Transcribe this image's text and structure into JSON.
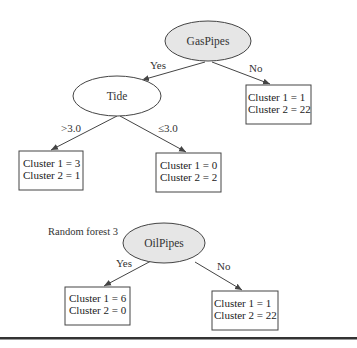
{
  "tree1": {
    "root": {
      "label": "GasPipes"
    },
    "edges": {
      "root_yes": "Yes",
      "root_no": "No",
      "tide_gt": ">3.0",
      "tide_le": "≤3.0"
    },
    "tide": {
      "label": "Tide"
    },
    "leaf_no": {
      "line1": "Cluster 1 = 1",
      "line2": "Cluster 2 = 22"
    },
    "leaf_gt": {
      "line1": "Cluster 1 = 3",
      "line2": "Cluster 2 = 1"
    },
    "leaf_le": {
      "line1": "Cluster 1 = 0",
      "line2": "Cluster 2 = 2"
    }
  },
  "tree2": {
    "title": "Random forest 3",
    "root": {
      "label": "OilPipes"
    },
    "edges": {
      "yes": "Yes",
      "no": "No"
    },
    "leaf_yes": {
      "line1": "Cluster 1 = 6",
      "line2": "Cluster 2 = 0"
    },
    "leaf_no": {
      "line1": "Cluster 1 = 1",
      "line2": "Cluster 2 = 22"
    }
  },
  "colors": {
    "root_fill": "#e6e6e6",
    "node_fill": "#ffffff",
    "stroke": "#444444",
    "rule": "#333333"
  }
}
